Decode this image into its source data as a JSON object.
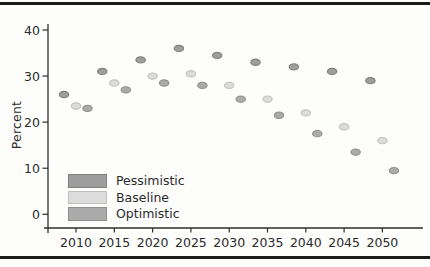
{
  "chart_data": {
    "type": "scatter",
    "title": "",
    "xlabel": "",
    "ylabel": "Percent",
    "x": [
      2010,
      2015,
      2020,
      2025,
      2030,
      2035,
      2040,
      2045,
      2050
    ],
    "x_tick_labels": [
      "2010",
      "2015",
      "2020",
      "2025",
      "2030",
      "2035",
      "2040",
      "2045",
      "2050"
    ],
    "y_ticks": [
      0,
      10,
      20,
      30,
      40
    ],
    "ylim": [
      0,
      40
    ],
    "grid": false,
    "legend_position": "inside-lower-left",
    "series": [
      {
        "name": "Pessimistic",
        "values": [
          26,
          31,
          33.5,
          36,
          34.5,
          33,
          32,
          31,
          29
        ],
        "fill": "#9e9e9e",
        "stroke": "#7f7f7f"
      },
      {
        "name": "Baseline",
        "values": [
          23.5,
          28.5,
          30,
          30.5,
          28,
          25,
          22,
          19,
          16
        ],
        "fill": "#dcdcdc",
        "stroke": "#c0c0c0"
      },
      {
        "name": "Optimistic",
        "values": [
          23,
          27,
          28.5,
          28,
          25,
          21.5,
          17.5,
          13.5,
          9.5
        ],
        "fill": "#ababab",
        "stroke": "#8e8e8e"
      }
    ],
    "axis_color": "#2e2e2e",
    "text_color": "#2b2b2b"
  }
}
